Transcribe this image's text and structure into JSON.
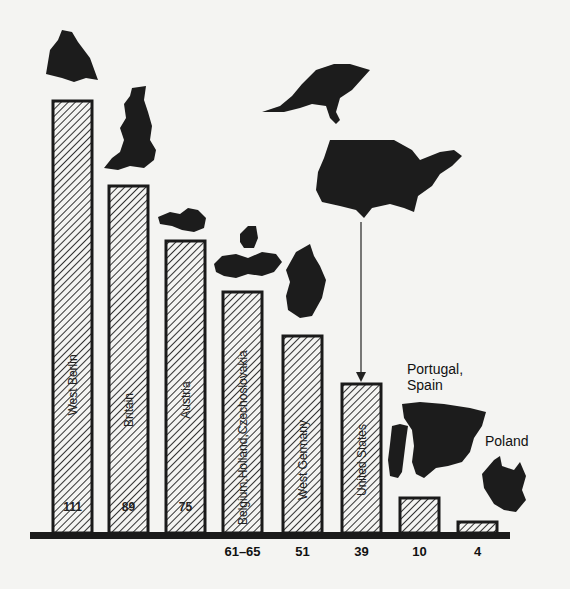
{
  "chart_data": {
    "type": "bar",
    "title": "",
    "xlabel": "",
    "ylabel": "",
    "grid": false,
    "legend": "none",
    "categories": [
      "West Berlin",
      "Britain",
      "Austria",
      "Belgium, Holland, Czechoslovakia",
      "West Germany",
      "United States",
      "Portugal, Spain",
      "Poland"
    ],
    "values": [
      111,
      89,
      75,
      63,
      51,
      39,
      10,
      4
    ],
    "value_labels": [
      "111",
      "89",
      "75",
      "61–65",
      "51",
      "39",
      "10",
      "4"
    ],
    "ylim": [
      0,
      120
    ],
    "annotations": [
      {
        "text": "Portugal,",
        "target": "Portugal, Spain"
      },
      {
        "text": "Spain",
        "target": "Portugal, Spain"
      },
      {
        "text": "Poland",
        "target": "Poland"
      }
    ],
    "decorations": "Silhouette maps of each country/region shown above its bar; arrow from US map down to United States bar"
  },
  "bars": [
    {
      "label": "West Berlin",
      "value_text": "111",
      "x": 53,
      "top": 101,
      "inside_value": true
    },
    {
      "label": "Britain",
      "value_text": "89",
      "x": 109,
      "top": 186,
      "inside_value": true
    },
    {
      "label": "Austria",
      "value_text": "75",
      "x": 166,
      "top": 241,
      "inside_value": true
    },
    {
      "label": "Belgium,Holland,Czechoslovakia",
      "value_text": "61–65",
      "x": 223,
      "top": 292,
      "inside_value": false
    },
    {
      "label": "West Germany",
      "value_text": "51",
      "x": 283,
      "top": 336,
      "inside_value": false
    },
    {
      "label": "United States",
      "value_text": "39",
      "x": 342,
      "top": 384,
      "inside_value": false
    },
    {
      "label": "",
      "value_text": "10",
      "x": 400,
      "top": 498,
      "inside_value": false
    },
    {
      "label": "",
      "value_text": "4",
      "x": 458,
      "top": 522,
      "inside_value": false
    }
  ],
  "annotations": {
    "portugal_line1": "Portugal,",
    "portugal_line2": "Spain",
    "poland": "Poland"
  }
}
